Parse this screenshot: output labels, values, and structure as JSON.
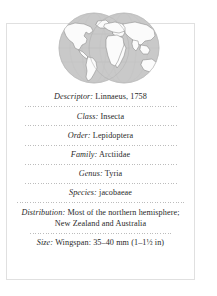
{
  "card": {
    "border_color": "#e0e0e0",
    "background": "#ffffff",
    "text_color": "#2a2a2a"
  },
  "graphic": {
    "name": "world-map-two-hemispheres",
    "ocean_color": "#c9c9c9",
    "land_color": "#fbfbfb",
    "outline_color": "#8f8f8f",
    "alt": "Two overlapping hemisphere globes showing world distribution"
  },
  "rows": [
    {
      "label": "Descriptor:",
      "value": "Linnaeus, 1758"
    },
    {
      "label": "Class:",
      "value": "Insecta"
    },
    {
      "label": "Order:",
      "value": "Lepidoptera"
    },
    {
      "label": "Family:",
      "value": "Arctiidae"
    },
    {
      "label": "Genus:",
      "value": "Tyria"
    },
    {
      "label": "Species:",
      "value": "jacobaeae"
    },
    {
      "label": "Distribution:",
      "value": "Most of the northern hemisphere; New Zealand and Australia"
    },
    {
      "label": "Size:",
      "value": "Wingspan: 35–40 mm (1–1½ in)"
    }
  ]
}
